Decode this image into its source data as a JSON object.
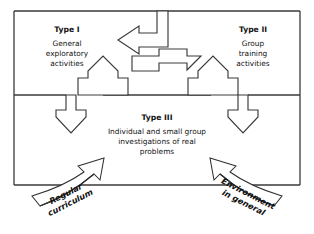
{
  "diagram": {
    "background_color": "#ffffff",
    "line_color": "#3a3a3a",
    "text_color": "#111111",
    "frame": {
      "name": "outer-box",
      "x": 14,
      "y": 11,
      "width": 286,
      "height": 174,
      "divider_y": 95
    },
    "quadrants": {
      "type_i": {
        "heading": "Type I",
        "lines": [
          "General",
          "exploratory",
          "activities"
        ]
      },
      "type_ii": {
        "heading": "Type II",
        "lines": [
          "Group",
          "training",
          "activities"
        ]
      },
      "type_iii": {
        "heading": "Type III",
        "lines": [
          "Individual and small group",
          "investigations of real",
          "problems"
        ]
      }
    },
    "input_arrows": [
      {
        "name": "regular-curriculum-arrow",
        "lines": [
          "Regular",
          "curriculum"
        ],
        "direction": "up-right",
        "side": "left"
      },
      {
        "name": "environment-arrow",
        "lines": [
          "Environment",
          "in general"
        ],
        "direction": "up-left",
        "side": "right"
      }
    ],
    "flow_arrows": [
      {
        "name": "arrow-top-left-pointing",
        "direction": "left",
        "position": "top-center"
      },
      {
        "name": "arrow-center-right-pointing",
        "direction": "right",
        "position": "center"
      },
      {
        "name": "arrow-left-up",
        "direction": "up",
        "position": "center-left"
      },
      {
        "name": "arrow-right-up",
        "direction": "up",
        "position": "center-right"
      },
      {
        "name": "arrow-left-down",
        "direction": "down",
        "position": "lower-left"
      },
      {
        "name": "arrow-right-down",
        "direction": "down",
        "position": "lower-right"
      }
    ]
  }
}
